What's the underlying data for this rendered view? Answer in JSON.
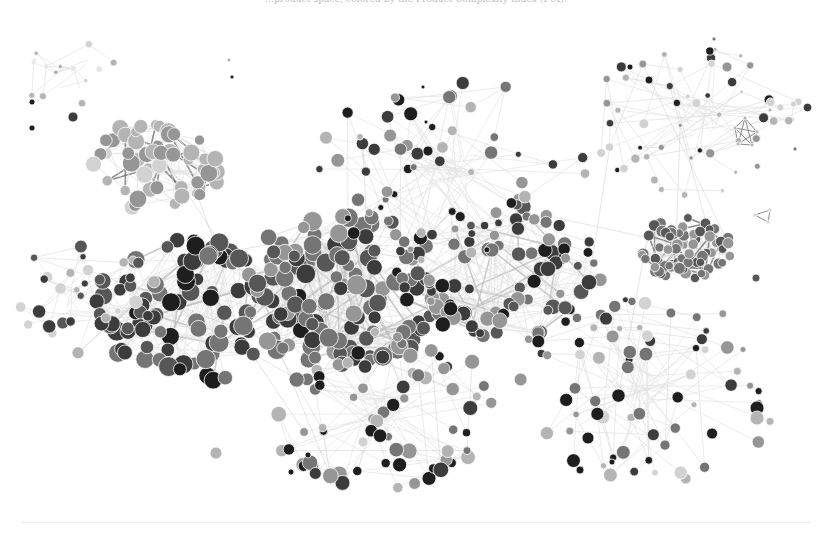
{
  "caption": {
    "text": "…product space, colored by the Product Complexity Index (PCI)."
  },
  "diagram": {
    "type": "network",
    "title": "Product Space",
    "color_encoding": "Product Complexity Index (PCI)",
    "palette": {
      "very_high": "#1e1e1e",
      "high": "#3c3c3c",
      "mid_high": "#575757",
      "mid": "#757575",
      "mid_low": "#969696",
      "low": "#b4b4b4",
      "very_low": "#d2d2d2",
      "faint": "#e6e6e6",
      "edge_light": "#e2e2e2",
      "edge_mid": "#bdbdbd",
      "edge_dark": "#707070"
    },
    "clusters": [
      {
        "name": "upper-left light cluster",
        "cx": 160,
        "cy": 165,
        "r": 55,
        "count": 55,
        "shades": [
          "low",
          "low",
          "mid_low",
          "very_low",
          "low"
        ],
        "size": [
          5,
          9
        ],
        "edge": "edge_dark",
        "dense": true
      },
      {
        "name": "upper-left branch",
        "cx": 70,
        "cy": 75,
        "r": 40,
        "count": 14,
        "shades": [
          "very_low",
          "faint",
          "low"
        ],
        "size": [
          2,
          4
        ],
        "edge": "edge_light",
        "dense": false
      },
      {
        "name": "left dark cluster",
        "cx": 200,
        "cy": 310,
        "r": 85,
        "count": 95,
        "shades": [
          "high",
          "high",
          "mid_high",
          "very_high",
          "mid"
        ],
        "size": [
          6,
          10
        ],
        "edge": "edge_mid",
        "dense": true
      },
      {
        "name": "central mid-gray core",
        "cx": 340,
        "cy": 290,
        "r": 90,
        "count": 120,
        "shades": [
          "mid",
          "mid",
          "mid_high",
          "mid_low",
          "high"
        ],
        "size": [
          6,
          10
        ],
        "edge": "edge_mid",
        "dense": true
      },
      {
        "name": "center-right core",
        "cx": 500,
        "cy": 270,
        "r": 85,
        "count": 90,
        "shades": [
          "mid",
          "mid_high",
          "high",
          "mid_low",
          "very_high"
        ],
        "size": [
          4,
          8
        ],
        "edge": "edge_mid",
        "dense": true
      },
      {
        "name": "right dense cluster",
        "cx": 688,
        "cy": 248,
        "r": 38,
        "count": 70,
        "shades": [
          "mid",
          "mid_high",
          "mid",
          "mid_low"
        ],
        "size": [
          4,
          6
        ],
        "edge": "edge_dark",
        "dense": true
      },
      {
        "name": "upper-right sparse",
        "cx": 700,
        "cy": 120,
        "r": 90,
        "count": 55,
        "shades": [
          "mid_low",
          "low",
          "very_low",
          "high",
          "very_high"
        ],
        "size": [
          2,
          5
        ],
        "edge": "edge_light",
        "dense": false
      },
      {
        "name": "upper-middle sparse",
        "cx": 450,
        "cy": 170,
        "r": 110,
        "count": 60,
        "shades": [
          "high",
          "mid",
          "very_high",
          "mid_low",
          "low"
        ],
        "size": [
          3,
          7
        ],
        "edge": "edge_light",
        "dense": false
      },
      {
        "name": "lower-middle",
        "cx": 380,
        "cy": 410,
        "r": 95,
        "count": 70,
        "shades": [
          "mid",
          "mid_low",
          "high",
          "very_high",
          "low"
        ],
        "size": [
          4,
          8
        ],
        "edge": "edge_light",
        "dense": false
      },
      {
        "name": "lower-right",
        "cx": 650,
        "cy": 390,
        "r": 110,
        "count": 70,
        "shades": [
          "very_high",
          "high",
          "mid",
          "mid_low",
          "low",
          "very_low"
        ],
        "size": [
          3,
          7
        ],
        "edge": "edge_light",
        "dense": false
      },
      {
        "name": "left fringe",
        "cx": 80,
        "cy": 300,
        "r": 70,
        "count": 30,
        "shades": [
          "high",
          "mid_high",
          "very_low",
          "low"
        ],
        "size": [
          3,
          7
        ],
        "edge": "edge_light",
        "dense": false
      }
    ],
    "landmarks": [
      {
        "x": 428,
        "y": 151,
        "r": 5,
        "shade": "very_high"
      },
      {
        "x": 423,
        "y": 87,
        "r": 2,
        "shade": "very_high"
      },
      {
        "x": 426,
        "y": 122,
        "r": 2,
        "shade": "very_high"
      },
      {
        "x": 232,
        "y": 77,
        "r": 2,
        "shade": "very_high"
      },
      {
        "x": 229,
        "y": 60,
        "r": 2,
        "shade": "low"
      },
      {
        "x": 73,
        "y": 117,
        "r": 5,
        "shade": "high"
      },
      {
        "x": 32,
        "y": 128,
        "r": 3,
        "shade": "very_high"
      },
      {
        "x": 32,
        "y": 102,
        "r": 3,
        "shade": "very_high"
      },
      {
        "x": 757,
        "y": 408,
        "r": 7,
        "shade": "very_high"
      },
      {
        "x": 757,
        "y": 418,
        "r": 7,
        "shade": "low"
      },
      {
        "x": 588,
        "y": 438,
        "r": 6,
        "shade": "very_high"
      },
      {
        "x": 580,
        "y": 470,
        "r": 4,
        "shade": "very_high"
      },
      {
        "x": 612,
        "y": 462,
        "r": 3,
        "shade": "very_high"
      },
      {
        "x": 291,
        "y": 472,
        "r": 3,
        "shade": "very_high"
      },
      {
        "x": 308,
        "y": 455,
        "r": 3,
        "shade": "very_high"
      },
      {
        "x": 216,
        "y": 453,
        "r": 6,
        "shade": "low"
      },
      {
        "x": 363,
        "y": 442,
        "r": 5,
        "shade": "very_low"
      },
      {
        "x": 756,
        "y": 278,
        "r": 4,
        "shade": "mid_high"
      },
      {
        "x": 795,
        "y": 149,
        "r": 2,
        "shade": "mid"
      },
      {
        "x": 770,
        "y": 110,
        "r": 2,
        "shade": "low"
      },
      {
        "x": 714,
        "y": 39,
        "r": 2,
        "shade": "mid"
      },
      {
        "x": 727,
        "y": 67,
        "r": 5,
        "shade": "mid_low"
      },
      {
        "x": 649,
        "y": 80,
        "r": 4,
        "shade": "very_high"
      },
      {
        "x": 630,
        "y": 67,
        "r": 3,
        "shade": "very_high"
      }
    ],
    "small_motifs": [
      {
        "name": "right triangle motif",
        "points": [
          [
            755,
            215
          ],
          [
            770,
            210
          ],
          [
            768,
            222
          ]
        ],
        "shade": "very_low"
      },
      {
        "name": "upper-right polygon motif",
        "points": [
          [
            745,
            118
          ],
          [
            735,
            128
          ],
          [
            738,
            144
          ],
          [
            752,
            145
          ],
          [
            757,
            132
          ]
        ],
        "shade": "low"
      }
    ],
    "seed": 20240
  }
}
